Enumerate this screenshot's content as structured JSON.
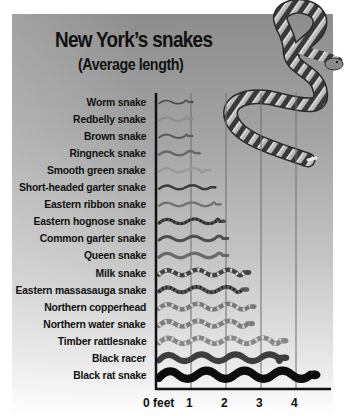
{
  "header": {
    "title": "New York’s snakes",
    "subtitle": "(Average length)"
  },
  "axis": {
    "ticks": [
      "0 feet",
      "1",
      "2",
      "3",
      "4"
    ]
  },
  "colors": {
    "background_top": "#8d8d8d",
    "background_bottom": "#ffffff",
    "axis": "#111111",
    "gridline": "#6e6e6e",
    "text": "#111111"
  },
  "chart_data": {
    "type": "bar",
    "title": "New York’s snakes",
    "subtitle": "(Average length)",
    "xlabel": "feet",
    "ylabel": "",
    "orientation": "horizontal",
    "xlim": [
      0,
      4.8
    ],
    "xticks": [
      0,
      1,
      2,
      3,
      4
    ],
    "grid": true,
    "categories": [
      "Worm snake",
      "Redbelly snake",
      "Brown snake",
      "Ringneck snake",
      "Smooth green snake",
      "Short-headed garter snake",
      "Eastern ribbon snake",
      "Eastern hognose snake",
      "Common garter snake",
      "Queen snake",
      "Milk snake",
      "Eastern massasauga snake",
      "Northern copperhead",
      "Northern water snake",
      "Timber rattlesnake",
      "Black racer",
      "Black rat snake"
    ],
    "values": [
      1.0,
      1.0,
      1.0,
      1.2,
      1.5,
      1.65,
      1.8,
      1.9,
      2.0,
      2.0,
      2.6,
      2.55,
      2.75,
      2.7,
      3.65,
      3.65,
      4.5
    ],
    "units": "feet"
  },
  "snakes": [
    {
      "name": "Worm snake",
      "color": "#4a4a4a",
      "width": 1.6,
      "pattern": "solid"
    },
    {
      "name": "Redbelly snake",
      "color": "#8c8c8c",
      "width": 1.8,
      "pattern": "solid"
    },
    {
      "name": "Brown snake",
      "color": "#5a5a5a",
      "width": 2.0,
      "pattern": "solid"
    },
    {
      "name": "Ringneck snake",
      "color": "#666666",
      "width": 2.4,
      "pattern": "solid"
    },
    {
      "name": "Smooth green snake",
      "color": "#9a9a9a",
      "width": 2.6,
      "pattern": "solid"
    },
    {
      "name": "Short-headed garter snake",
      "color": "#3a3a3a",
      "width": 2.4,
      "pattern": "solid"
    },
    {
      "name": "Eastern ribbon snake",
      "color": "#707070",
      "width": 2.2,
      "pattern": "solid"
    },
    {
      "name": "Eastern hognose snake",
      "color": "#4a4a4a",
      "width": 3.2,
      "pattern": "dashed"
    },
    {
      "name": "Common garter snake",
      "color": "#4e4e4e",
      "width": 3.0,
      "pattern": "solid"
    },
    {
      "name": "Queen snake",
      "color": "#6a6a6a",
      "width": 3.2,
      "pattern": "solid"
    },
    {
      "name": "Milk snake",
      "color": "#444444",
      "width": 4.4,
      "pattern": "banded"
    },
    {
      "name": "Eastern massasauga snake",
      "color": "#5a5a5a",
      "width": 4.0,
      "pattern": "dashed"
    },
    {
      "name": "Northern copperhead",
      "color": "#7a7a7a",
      "width": 4.4,
      "pattern": "banded"
    },
    {
      "name": "Northern water snake",
      "color": "#7e7e7e",
      "width": 4.6,
      "pattern": "banded"
    },
    {
      "name": "Timber rattlesnake",
      "color": "#888888",
      "width": 5.0,
      "pattern": "banded"
    },
    {
      "name": "Black racer",
      "color": "#3e3e3e",
      "width": 6.0,
      "pattern": "solid"
    },
    {
      "name": "Black rat snake",
      "color": "#0c0c0c",
      "width": 8.0,
      "pattern": "solid"
    }
  ]
}
